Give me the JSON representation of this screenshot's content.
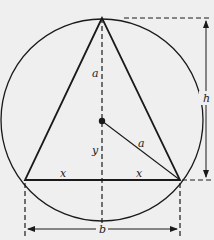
{
  "figure": {
    "background": "#efefef",
    "stroke_color": "#1a1a1a"
  },
  "labels": {
    "a_vertical": "a",
    "a_radius": "a",
    "y": "y",
    "x_left": "x",
    "x_right": "x",
    "h": "h",
    "b": "b"
  },
  "geometry": {
    "circle": {
      "cx": 102,
      "cy": 120,
      "r": 101
    },
    "triangle": {
      "apex": [
        102,
        18
      ],
      "bottom_left": [
        25,
        180
      ],
      "bottom_right": [
        180,
        180
      ]
    },
    "center_dot": [
      102,
      121
    ]
  }
}
